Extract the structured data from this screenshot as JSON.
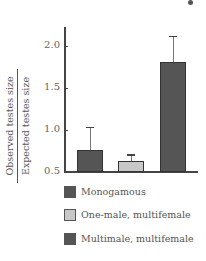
{
  "chart_data": {
    "type": "bar",
    "title": "",
    "xlabel": "",
    "ylabel": "Observed testes size / Expected testes size",
    "ylabel_numerator": "Observed testes size",
    "ylabel_denominator": "Expected testes size",
    "ylim": [
      0.5,
      2.2
    ],
    "yticks": [
      "0.5",
      "1.0",
      "1.5",
      "2.0"
    ],
    "categories": [
      "Monogamous",
      "One-male, multifemale",
      "Multimale, multifemale"
    ],
    "values": [
      0.76,
      0.63,
      1.81
    ],
    "error_upper": [
      1.04,
      0.71,
      2.12
    ],
    "colors": [
      "#555555",
      "#c8c8c8",
      "#555555"
    ],
    "legend": [
      "Monogamous",
      "One-male, multifemale",
      "Multimale, multifemale"
    ],
    "legend_position": "bottom",
    "grid": false
  }
}
